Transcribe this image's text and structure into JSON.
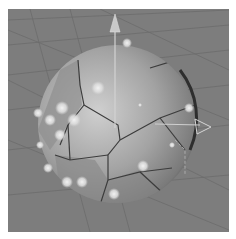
{
  "viewport": {
    "background": "#7d7d7d",
    "grid_color": "#6e6e6e",
    "object": "voronoi-fractured-sphere",
    "sphere": {
      "cx": 117,
      "cy": 163,
      "r": 79
    },
    "gizmo": {
      "y_axis_color": "#c9c9c9",
      "x_axis_color": "#cfcfcf"
    },
    "particles_count": 16
  }
}
